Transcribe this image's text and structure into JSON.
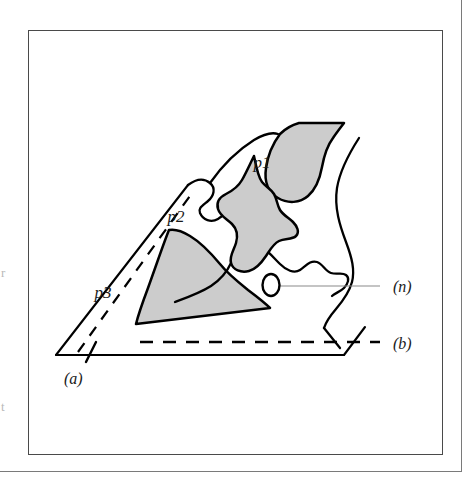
{
  "figure": {
    "background_color": "#ffffff",
    "outline_color": "#000000",
    "shading_color": "#cccccc",
    "frame_color": "#4a4a4a",
    "outer_frame_color": "#7a7a7a",
    "leader_line_color": "#8a8a8a",
    "regions": [
      {
        "id": "p1",
        "label": "p1",
        "label_x": 234,
        "label_y": 138,
        "fill": "#cccccc"
      },
      {
        "id": "p2",
        "label": "p2",
        "label_x": 148,
        "label_y": 192,
        "fill": "#cccccc"
      },
      {
        "id": "p3",
        "label": "p3",
        "label_x": 75,
        "label_y": 268,
        "fill": "#cccccc"
      }
    ],
    "callouts": [
      {
        "id": "n",
        "label": "(n)",
        "label_x": 365,
        "label_y": 256,
        "target": "small-ellipse"
      },
      {
        "id": "b",
        "label": "(b)",
        "label_x": 365,
        "label_y": 313,
        "target": "horizontal-dashed-line"
      },
      {
        "id": "a",
        "label": "(a)",
        "label_x": 36,
        "label_y": 348,
        "target": "tick-mark-on-baseline"
      }
    ],
    "margin_glyphs": {
      "top": "r",
      "bottom": "t"
    }
  }
}
